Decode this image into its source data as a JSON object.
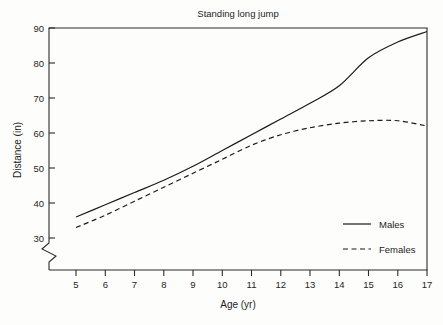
{
  "chart_data": {
    "type": "line",
    "title": "Standing long jump",
    "xlabel": "Age (yr)",
    "ylabel": "Distance (in)",
    "x": [
      5,
      6,
      7,
      8,
      9,
      10,
      11,
      12,
      13,
      14,
      15,
      16,
      17
    ],
    "xticklabels": [
      "5",
      "6",
      "7",
      "8",
      "9",
      "10",
      "11",
      "12",
      "13",
      "14",
      "15",
      "16",
      "17"
    ],
    "yticklabels": [
      "30",
      "40",
      "50",
      "60",
      "70",
      "80",
      "90"
    ],
    "yticks": [
      30,
      40,
      50,
      60,
      70,
      80,
      90
    ],
    "xlim": [
      5,
      17
    ],
    "ylim": [
      30,
      90
    ],
    "grid": false,
    "axis_break": true,
    "axis_break_note": "y-axis broken below 30",
    "legend_position": "lower right inside plot",
    "series": [
      {
        "name": "Males",
        "style": "solid",
        "color": "#1b1b1b",
        "values": [
          36.0,
          39.5,
          43.0,
          46.5,
          50.5,
          55.0,
          59.5,
          64.0,
          68.5,
          73.5,
          81.5,
          86.0,
          89.0
        ]
      },
      {
        "name": "Females",
        "style": "dashed",
        "color": "#1b1b1b",
        "values": [
          33.0,
          36.5,
          40.5,
          44.5,
          48.5,
          52.5,
          56.5,
          59.5,
          61.5,
          62.8,
          63.5,
          63.5,
          62.0
        ]
      }
    ]
  },
  "legend": {
    "entries": [
      {
        "label": "Males",
        "style": "solid"
      },
      {
        "label": "Females",
        "style": "dashed"
      }
    ]
  }
}
